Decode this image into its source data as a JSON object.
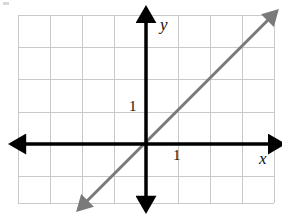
{
  "figure": {
    "kind": "coordinate-grid-graph",
    "width": 282,
    "height": 221,
    "background_color": "#ffffff"
  },
  "grid": {
    "line_color": "#c9c9c9",
    "line_width": 1,
    "left": 18,
    "top": 15,
    "right": 274,
    "bottom": 203,
    "cell_size": 32,
    "columns": 8,
    "rows": 6,
    "vertical_line_x": [
      18,
      50,
      82,
      114,
      146,
      178,
      210,
      242,
      274
    ],
    "horizontal_line_y": [
      15,
      47,
      79,
      112,
      144,
      176,
      203
    ]
  },
  "axes": {
    "color": "#000000",
    "stroke_width": 3.5,
    "origin": {
      "x": 146,
      "y": 144
    },
    "x_axis": {
      "label": "x",
      "from_x": 22,
      "to_x": 272,
      "y": 144,
      "arrowheads": "both",
      "tick_label": "1",
      "tick_value": 1
    },
    "y_axis": {
      "label": "y",
      "x": 146,
      "from_y": 200,
      "to_y": 19,
      "arrowheads": "both",
      "tick_label": "1",
      "tick_value": 1
    }
  },
  "plotted_line": {
    "name": "diagonal-line",
    "color": "#7a7a7a",
    "stroke_width": 3,
    "arrowheads": "both",
    "equation": "y = x",
    "slope": 1,
    "y_intercept": 0,
    "start_point": {
      "x": 85,
      "y": 203
    },
    "end_point": {
      "x": 270,
      "y": 18
    },
    "passes_through": [
      [
        -2,
        -2
      ],
      [
        -1,
        -1
      ],
      [
        0,
        0
      ],
      [
        1,
        1
      ],
      [
        2,
        2
      ],
      [
        3,
        3
      ],
      [
        4,
        4
      ]
    ]
  },
  "chart_data": {
    "type": "line",
    "title": "",
    "xlabel": "x",
    "ylabel": "y",
    "xlim": [
      -4,
      4
    ],
    "ylim": [
      -2,
      4
    ],
    "grid": true,
    "legend": "none",
    "tick_labels": {
      "x": [
        "1"
      ],
      "y": [
        "1"
      ]
    },
    "series": [
      {
        "name": "y = x",
        "color": "#7a7a7a",
        "x": [
          -1.9,
          3.9
        ],
        "values": [
          -1.9,
          3.9
        ]
      }
    ]
  }
}
